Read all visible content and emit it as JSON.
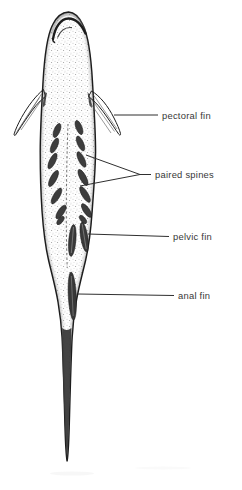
{
  "figure": {
    "labels": {
      "pectoral_fin": "pectoral fin",
      "paired_spines": "paired spines",
      "pelvic_fin": "pelvic fin",
      "anal_fin": "anal fin"
    },
    "colors": {
      "background": "#ffffff",
      "ink": "#1c1c1c",
      "label_text": "#383838",
      "fin_blade_fill": "#3a3a3a"
    }
  }
}
